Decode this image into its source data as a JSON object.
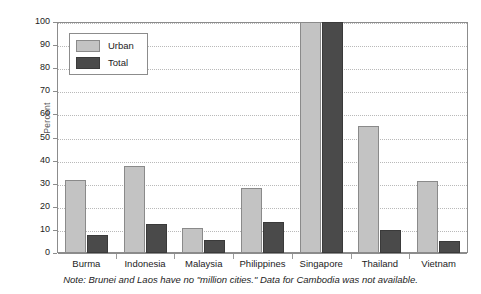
{
  "chart_data": {
    "type": "bar",
    "title": "",
    "xlabel": "",
    "ylabel": "Percent",
    "ylim": [
      0,
      100
    ],
    "yticks": [
      0,
      10,
      20,
      30,
      40,
      50,
      60,
      70,
      80,
      90,
      100
    ],
    "grid": true,
    "legend_position": "upper-left-inside",
    "categories": [
      "Burma",
      "Indonesia",
      "Malaysia",
      "Philippines",
      "Singapore",
      "Thailand",
      "Vietnam"
    ],
    "series": [
      {
        "name": "Urban",
        "color": "#c3c3c3",
        "values": [
          31.5,
          37.5,
          11,
          28,
          100,
          55,
          31
        ]
      },
      {
        "name": "Total",
        "color": "#4a4a4a",
        "values": [
          8,
          12.5,
          5.5,
          13.5,
          100,
          10,
          5
        ]
      }
    ],
    "annotations": [
      "Note: Brunei and Laos have no \"million cities.\" Data for Cambodia was not available."
    ]
  },
  "axis": {
    "y_title": "Percent",
    "y_tick_labels": [
      "100",
      "90",
      "80",
      "70",
      "60",
      "50",
      "40",
      "30",
      "20",
      "10",
      "0"
    ]
  },
  "legend": {
    "items": [
      {
        "label": "Urban"
      },
      {
        "label": "Total"
      }
    ]
  },
  "footnote": {
    "text": "Note: Brunei and Laos have no \"million cities.\" Data for Cambodia was not available."
  }
}
